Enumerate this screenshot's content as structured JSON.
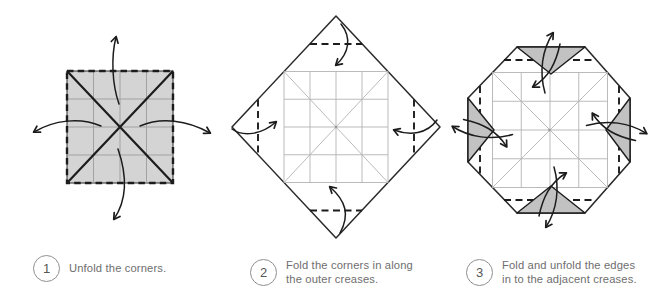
{
  "figure": {
    "type": "origami-instruction-diagram",
    "background": "#ffffff",
    "colors": {
      "paper_fill": "#d4d4d4",
      "flap_fill": "#c2c2c2",
      "outline": "#2a2a2a",
      "ink": "#1c1c1c",
      "crease": "#b3b3b3",
      "grid_on_paper": "#a2a2a2",
      "text": "#6e6e6e",
      "badge_border": "#8f8f8f",
      "background": "#ffffff"
    }
  },
  "steps": [
    {
      "number": "1",
      "lines": [
        "Unfold the corners."
      ]
    },
    {
      "number": "2",
      "lines": [
        "Fold the corners in along",
        "the outer creases."
      ]
    },
    {
      "number": "3",
      "lines": [
        "Fold and unfold the edges",
        "in to the adjacent creases."
      ]
    }
  ]
}
